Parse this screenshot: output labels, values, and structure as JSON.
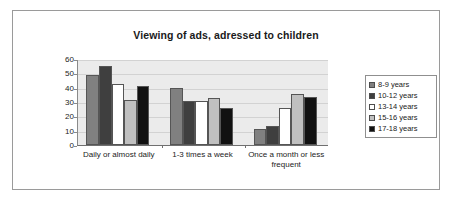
{
  "chart_data": {
    "type": "bar",
    "title": "Viewing of ads, adressed to children",
    "xlabel": "",
    "ylabel": "",
    "ylim": [
      0,
      60
    ],
    "ytick_step": 10,
    "ytick_labels": [
      "60",
      "50",
      "40",
      "30",
      "20",
      "10",
      "0"
    ],
    "grid": true,
    "legend_position": "right",
    "categories": [
      "Daily or almost daily",
      "1-3 times a week",
      "Once a month or less frequent"
    ],
    "series": [
      {
        "name": "8-9 years",
        "color": "#808080",
        "values": [
          49,
          40,
          11.5
        ]
      },
      {
        "name": "10-12 years",
        "color": "#3f3f3f",
        "values": [
          55,
          31,
          13.5
        ]
      },
      {
        "name": "13-14 years",
        "color": "#ffffff",
        "values": [
          42.5,
          31,
          25.5
        ]
      },
      {
        "name": "15-16 years",
        "color": "#c0c0c0",
        "values": [
          31.5,
          32.5,
          35.5
        ]
      },
      {
        "name": "17-18 years",
        "color": "#111111",
        "values": [
          41,
          25.5,
          33.5
        ]
      }
    ]
  },
  "colors": {
    "plot_background": "#ebebeb",
    "gridline": "#d2d2d2",
    "axis": "#6f6f6f",
    "frame_border": "#9a9a9a",
    "text": "#232323"
  }
}
